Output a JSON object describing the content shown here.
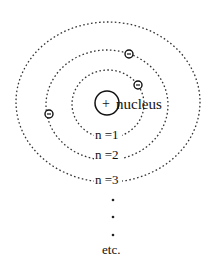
{
  "diagram": {
    "nucleus": {
      "symbol": "+",
      "label": "nucleus",
      "cx": 107,
      "cy": 103,
      "r": 12
    },
    "orbits": [
      {
        "label": "n =1",
        "cx": 108,
        "cy": 104,
        "rx": 36,
        "ry": 34
      },
      {
        "label": "n =2",
        "cx": 107,
        "cy": 105,
        "rx": 61,
        "ry": 55
      },
      {
        "label": "n =3",
        "cx": 108,
        "cy": 102,
        "rx": 92,
        "ry": 80
      }
    ],
    "electrons": [
      {
        "symbol": "-",
        "cx": 129,
        "cy": 54
      },
      {
        "symbol": "-",
        "cx": 138,
        "cy": 85
      },
      {
        "symbol": "-",
        "cx": 49,
        "cy": 114
      }
    ],
    "continuation": {
      "dots": 3,
      "label": "etc."
    }
  }
}
